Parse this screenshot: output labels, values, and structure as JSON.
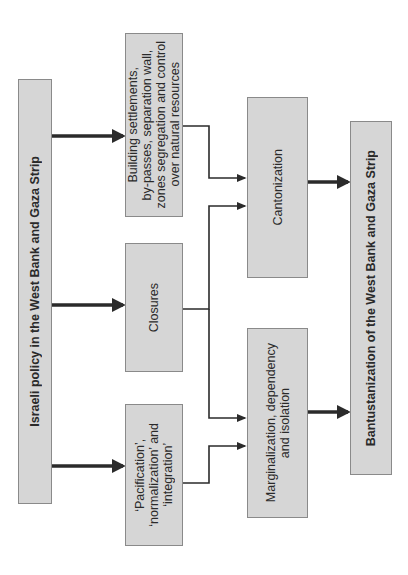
{
  "diagram": {
    "type": "flowchart",
    "orientation": "rotated-90deg-counterclockwise",
    "colors": {
      "box_fill": "#d6d6d6",
      "box_border": "#8a8a8a",
      "arrow": "#2b2b2b",
      "background": "#ffffff"
    },
    "nodes": {
      "source": {
        "label": "Israeli policy in the West Bank and Gaza Strip"
      },
      "settlements": {
        "label": "Building settlements,\nby-passes, separation wall,\nzones segregation and control\nover natural resources"
      },
      "closures": {
        "label": "Closures"
      },
      "pacification": {
        "label": "‘Pacification’,\n‘normalization’ and\n‘integration’"
      },
      "cantonization": {
        "label": "Cantonization"
      },
      "marginalization": {
        "label": "Marginalization, dependency\nand isolation"
      },
      "outcome": {
        "label": "Bantustanization of the West Bank and Gaza Strip"
      }
    },
    "edges": [
      {
        "from": "source",
        "to": "settlements",
        "style": "thick"
      },
      {
        "from": "source",
        "to": "closures",
        "style": "thick"
      },
      {
        "from": "source",
        "to": "pacification",
        "style": "thick"
      },
      {
        "from": "settlements",
        "to": "cantonization",
        "style": "thin-elbow"
      },
      {
        "from": "closures",
        "to": "cantonization",
        "style": "thin-elbow"
      },
      {
        "from": "closures",
        "to": "marginalization",
        "style": "thin-elbow"
      },
      {
        "from": "pacification",
        "to": "marginalization",
        "style": "thin-elbow"
      },
      {
        "from": "cantonization",
        "to": "outcome",
        "style": "thick"
      },
      {
        "from": "marginalization",
        "to": "outcome",
        "style": "thick"
      }
    ]
  }
}
